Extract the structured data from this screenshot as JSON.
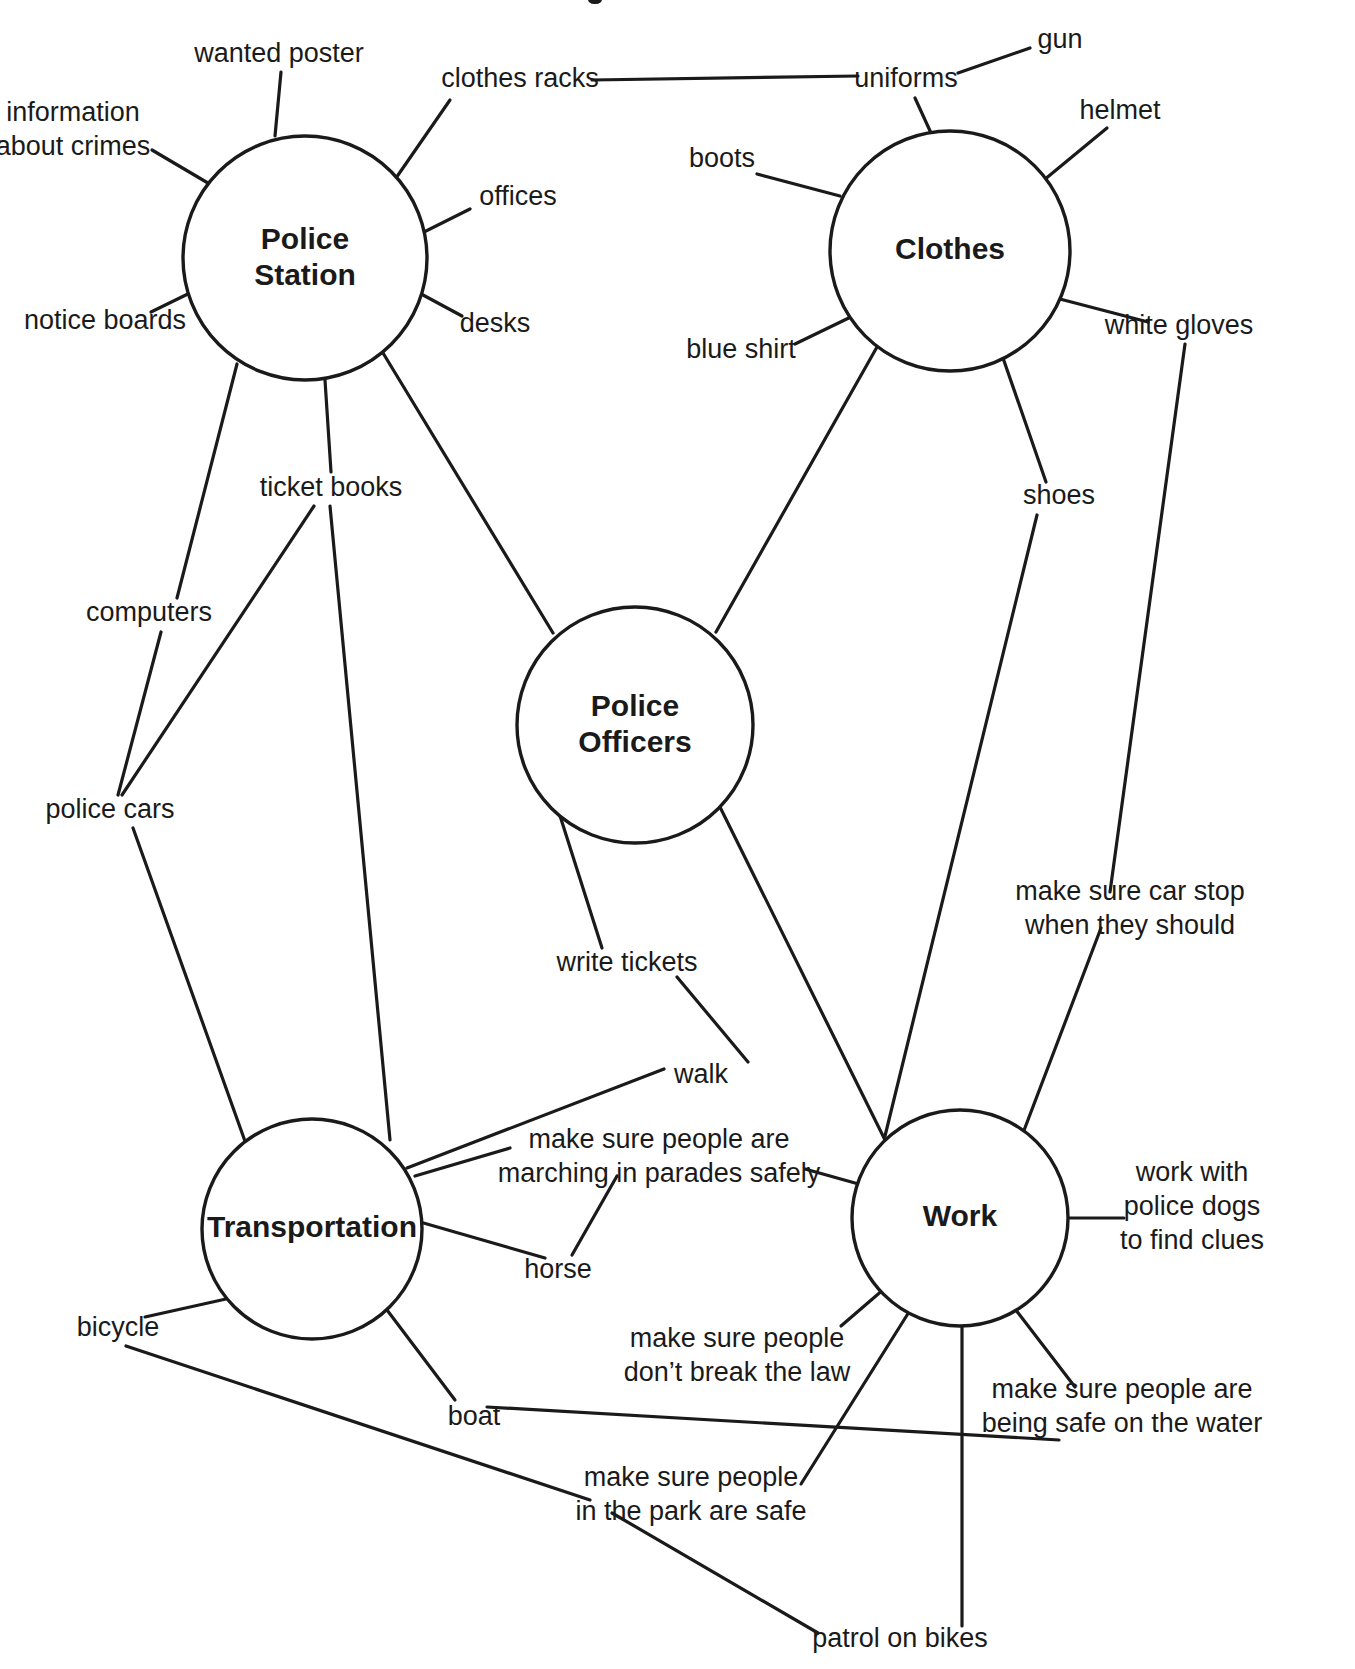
{
  "diagram": {
    "type": "concept-map",
    "background_color": "#ffffff",
    "line_color": "#1a1a1a",
    "text_color": "#1a1a1a",
    "nodes": [
      {
        "id": "police_station",
        "label_line1": "Police",
        "label_line2": "Station",
        "cx": 305,
        "cy": 258,
        "r": 122
      },
      {
        "id": "clothes",
        "label_line1": "Clothes",
        "label_line2": "",
        "cx": 950,
        "cy": 251,
        "r": 120
      },
      {
        "id": "police_officers",
        "label_line1": "Police",
        "label_line2": "Officers",
        "cx": 635,
        "cy": 725,
        "r": 118
      },
      {
        "id": "transportation",
        "label_line1": "Transportation",
        "label_line2": "",
        "cx": 312,
        "cy": 1229,
        "r": 110
      },
      {
        "id": "work",
        "label_line1": "Work",
        "label_line2": "",
        "cx": 960,
        "cy": 1218,
        "r": 108
      }
    ],
    "leaves": [
      {
        "id": "wanted_poster",
        "text_line1": "wanted poster",
        "text_line2": "",
        "x": 279,
        "y": 55,
        "anchor": "middle"
      },
      {
        "id": "clothes_racks",
        "text_line1": "clothes racks",
        "text_line2": "",
        "x": 520,
        "y": 80,
        "anchor": "middle"
      },
      {
        "id": "uniforms",
        "text_line1": "uniforms",
        "text_line2": "",
        "x": 906,
        "y": 80,
        "anchor": "middle"
      },
      {
        "id": "gun",
        "text_line1": "gun",
        "text_line2": "",
        "x": 1060,
        "y": 41,
        "anchor": "middle"
      },
      {
        "id": "helmet",
        "text_line1": "helmet",
        "text_line2": "",
        "x": 1120,
        "y": 112,
        "anchor": "middle"
      },
      {
        "id": "information_about_crimes",
        "text_line1": "information",
        "text_line2": "about crimes",
        "x": 73,
        "y": 131,
        "anchor": "middle"
      },
      {
        "id": "boots",
        "text_line1": "boots",
        "text_line2": "",
        "x": 722,
        "y": 160,
        "anchor": "middle"
      },
      {
        "id": "offices",
        "text_line1": "offices",
        "text_line2": "",
        "x": 518,
        "y": 198,
        "anchor": "middle"
      },
      {
        "id": "desks",
        "text_line1": "desks",
        "text_line2": "",
        "x": 495,
        "y": 325,
        "anchor": "middle"
      },
      {
        "id": "notice_boards",
        "text_line1": "notice boards",
        "text_line2": "",
        "x": 105,
        "y": 322,
        "anchor": "middle"
      },
      {
        "id": "blue_shirt",
        "text_line1": "blue shirt",
        "text_line2": "",
        "x": 741,
        "y": 351,
        "anchor": "middle"
      },
      {
        "id": "white_gloves",
        "text_line1": "white gloves",
        "text_line2": "",
        "x": 1179,
        "y": 327,
        "anchor": "middle"
      },
      {
        "id": "ticket_books",
        "text_line1": "ticket books",
        "text_line2": "",
        "x": 331,
        "y": 489,
        "anchor": "middle"
      },
      {
        "id": "shoes",
        "text_line1": "shoes",
        "text_line2": "",
        "x": 1059,
        "y": 497,
        "anchor": "middle"
      },
      {
        "id": "computers",
        "text_line1": "computers",
        "text_line2": "",
        "x": 149,
        "y": 614,
        "anchor": "middle"
      },
      {
        "id": "police_cars",
        "text_line1": "police cars",
        "text_line2": "",
        "x": 110,
        "y": 811,
        "anchor": "middle"
      },
      {
        "id": "make_sure_car_stop",
        "text_line1": "make sure car stop",
        "text_line2": "when they should",
        "x": 1130,
        "y": 910,
        "anchor": "middle"
      },
      {
        "id": "write_tickets",
        "text_line1": "write tickets",
        "text_line2": "",
        "x": 627,
        "y": 964,
        "anchor": "middle"
      },
      {
        "id": "walk",
        "text_line1": "walk",
        "text_line2": "",
        "x": 701,
        "y": 1076,
        "anchor": "middle"
      },
      {
        "id": "make_sure_parades",
        "text_line1": "make sure people are",
        "text_line2": "marching in parades safely",
        "x": 659,
        "y": 1158,
        "anchor": "middle"
      },
      {
        "id": "work_with_police_dogs",
        "text_line1": "work with",
        "text_line2": "police dogs",
        "text_line3": "to find clues",
        "x": 1192,
        "y": 1208,
        "anchor": "middle"
      },
      {
        "id": "horse",
        "text_line1": "horse",
        "text_line2": "",
        "x": 558,
        "y": 1271,
        "anchor": "middle"
      },
      {
        "id": "bicycle",
        "text_line1": "bicycle",
        "text_line2": "",
        "x": 118,
        "y": 1329,
        "anchor": "middle"
      },
      {
        "id": "make_sure_break_law",
        "text_line1": "make sure people",
        "text_line2": "don’t break the law",
        "x": 737,
        "y": 1357,
        "anchor": "middle"
      },
      {
        "id": "boat",
        "text_line1": "boat",
        "text_line2": "",
        "x": 474,
        "y": 1418,
        "anchor": "middle"
      },
      {
        "id": "make_sure_safe_water",
        "text_line1": "make sure people are",
        "text_line2": "being safe on the water",
        "x": 1122,
        "y": 1408,
        "anchor": "middle"
      },
      {
        "id": "make_sure_park_safe",
        "text_line1": "make sure people",
        "text_line2": "in the park are safe",
        "x": 691,
        "y": 1496,
        "anchor": "middle"
      },
      {
        "id": "patrol_on_bikes",
        "text_line1": "patrol on bikes",
        "text_line2": "",
        "x": 900,
        "y": 1640,
        "anchor": "middle"
      }
    ],
    "edges": [
      {
        "id": "police_station-wanted_poster",
        "from": "police_station",
        "to": "wanted_poster",
        "points": "275,136 281,72"
      },
      {
        "id": "police_station-clothes_racks",
        "from": "police_station",
        "to": "clothes_racks",
        "points": "396,178 450,100"
      },
      {
        "id": "clothes_racks-uniforms",
        "from": "clothes_racks",
        "to": "uniforms",
        "points": "592,80 858,76"
      },
      {
        "id": "uniforms-gun",
        "from": "uniforms",
        "to": "gun",
        "points": "958,73 1030,48"
      },
      {
        "id": "uniforms-clothes",
        "from": "uniforms",
        "to": "clothes",
        "points": "915,98 931,133"
      },
      {
        "id": "clothes-helmet",
        "from": "clothes",
        "to": "helmet",
        "points": "1044,180 1107,128"
      },
      {
        "id": "police_station-information_about_crimes",
        "from": "police_station",
        "to": "information_about_crimes",
        "points": "213,186 152,150"
      },
      {
        "id": "clothes-boots",
        "from": "clothes",
        "to": "boots",
        "points": "840,196 757,174"
      },
      {
        "id": "police_station-offices",
        "from": "police_station",
        "to": "offices",
        "points": "420,234 470,209"
      },
      {
        "id": "police_station-desks",
        "from": "police_station",
        "to": "desks",
        "points": "410,288 462,316"
      },
      {
        "id": "police_station-notice_boards",
        "from": "police_station",
        "to": "notice_boards",
        "points": "196,290 151,312"
      },
      {
        "id": "clothes-blue_shirt",
        "from": "clothes",
        "to": "blue_shirt",
        "points": "857,314 795,344"
      },
      {
        "id": "clothes-white_gloves",
        "from": "clothes",
        "to": "white_gloves",
        "points": "1056,298 1148,322"
      },
      {
        "id": "police_station-ticket_books",
        "from": "police_station",
        "to": "ticket_books",
        "points": "325,380 331,472"
      },
      {
        "id": "police_station-computers",
        "from": "police_station",
        "to": "computers",
        "points": "237,364 177,598"
      },
      {
        "id": "computers-police_cars",
        "from": "computers",
        "to": "police_cars",
        "points": "161,632 118,795"
      },
      {
        "id": "ticket_books-police_cars",
        "from": "ticket_books",
        "to": "police_cars",
        "points": "314,506 122,795"
      },
      {
        "id": "police_station-police_officers",
        "from": "police_station",
        "to": "police_officers",
        "points": "380,348 553,633"
      },
      {
        "id": "clothes-shoes",
        "from": "clothes",
        "to": "shoes",
        "points": "1003,358 1046,482"
      },
      {
        "id": "clothes-police_officers",
        "from": "clothes",
        "to": "police_officers",
        "points": "877,347 716,632"
      },
      {
        "id": "white_gloves-make_sure_car_stop",
        "from": "white_gloves",
        "to": "make_sure_car_stop",
        "points": "1185,344 1110,892"
      },
      {
        "id": "ticket_books-transportation",
        "from": "ticket_books",
        "to": "transportation",
        "points": "330,506 390,1140"
      },
      {
        "id": "police_cars-transportation",
        "from": "police_cars",
        "to": "transportation",
        "points": "133,828 246,1144"
      },
      {
        "id": "police_officers-write_tickets",
        "from": "police_officers",
        "to": "write_tickets",
        "points": "555,800 602,948"
      },
      {
        "id": "write_tickets-walk",
        "from": "write_tickets",
        "to": "walk",
        "points": "677,977 748,1062"
      },
      {
        "id": "walk-transportation",
        "from": "walk",
        "to": "transportation",
        "points": "664,1069 407,1168"
      },
      {
        "id": "police_officers-work",
        "from": "police_officers",
        "to": "work",
        "points": "718,803 889,1148"
      },
      {
        "id": "shoes-work",
        "from": "shoes",
        "to": "work",
        "points": "1037,515 885,1136"
      },
      {
        "id": "make_sure_car_stop-work",
        "from": "make_sure_car_stop",
        "to": "work",
        "points": "1101,928 1023,1133"
      },
      {
        "id": "transportation-make_sure_parades",
        "from": "transportation",
        "to": "make_sure_parades",
        "points": "415,1176 510,1148"
      },
      {
        "id": "make_sure_parades-work",
        "from": "make_sure_parades",
        "to": "work",
        "points": "805,1169 880,1190"
      },
      {
        "id": "transportation-horse",
        "from": "transportation",
        "to": "horse",
        "points": "420,1222 545,1258"
      },
      {
        "id": "horse-make_sure_parades",
        "from": "horse",
        "to": "make_sure_parades",
        "points": "572,1255 617,1176"
      },
      {
        "id": "work-work_with_police_dogs",
        "from": "work",
        "to": "work_with_police_dogs",
        "points": "1068,1218 1124,1218"
      },
      {
        "id": "transportation-bicycle",
        "from": "transportation",
        "to": "bicycle",
        "points": "235,1297 145,1317"
      },
      {
        "id": "work-make_sure_break_law",
        "from": "work",
        "to": "make_sure_break_law",
        "points": "884,1289 841,1326"
      },
      {
        "id": "transportation-boat",
        "from": "transportation",
        "to": "boat",
        "points": "384,1306 455,1400"
      },
      {
        "id": "boat-make_sure_safe_water",
        "from": "boat",
        "to": "make_sure_safe_water",
        "points": "487,1407 1059,1440"
      },
      {
        "id": "work-make_sure_safe_water",
        "from": "work",
        "to": "make_sure_safe_water",
        "points": "1012,1305 1075,1387"
      },
      {
        "id": "work-make_sure_park_safe",
        "from": "work",
        "to": "make_sure_park_safe",
        "points": "914,1304 801,1484"
      },
      {
        "id": "bicycle-make_sure_park_safe",
        "from": "bicycle",
        "to": "make_sure_park_safe",
        "points": "126,1346 590,1500"
      },
      {
        "id": "work-patrol_on_bikes",
        "from": "work",
        "to": "patrol_on_bikes",
        "points": "962,1326 962,1626"
      },
      {
        "id": "make_sure_park_safe-patrol_on_bikes",
        "from": "make_sure_park_safe",
        "to": "patrol_on_bikes",
        "points": "612,1513 818,1633"
      }
    ]
  }
}
